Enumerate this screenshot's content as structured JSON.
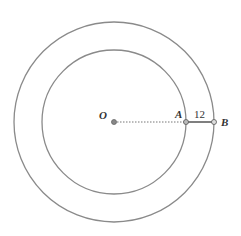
{
  "diagram": {
    "type": "concentric-circles",
    "center": {
      "label": "O",
      "x": 114,
      "y": 122
    },
    "inner_circle": {
      "r": 72,
      "stroke": "#888888"
    },
    "outer_circle": {
      "r": 100,
      "stroke": "#888888"
    },
    "points": [
      {
        "label": "O",
        "x": 114,
        "y": 122
      },
      {
        "label": "A",
        "x": 186,
        "y": 122
      },
      {
        "label": "B",
        "x": 214,
        "y": 122
      }
    ],
    "segments": [
      {
        "from": "O",
        "to": "A",
        "style": "dotted"
      },
      {
        "from": "A",
        "to": "B",
        "style": "solid",
        "label": "12"
      }
    ],
    "labels": {
      "O": "O",
      "A": "A",
      "B": "B",
      "AB_length": "12"
    }
  }
}
